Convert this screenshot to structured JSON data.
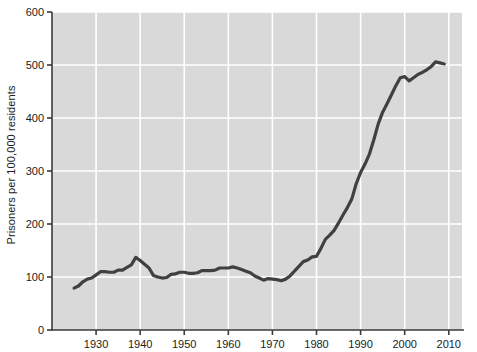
{
  "chart_data": {
    "type": "line",
    "title": "",
    "xlabel": "",
    "ylabel": "Prisoners per 100,000 residents",
    "xlim": [
      1920,
      2013
    ],
    "ylim": [
      0,
      600
    ],
    "grid": true,
    "legend": "none",
    "series": [
      {
        "name": "U.S. incarceration rate",
        "color": "#404040",
        "x": [
          1925,
          1926,
          1927,
          1928,
          1929,
          1930,
          1931,
          1932,
          1933,
          1934,
          1935,
          1936,
          1937,
          1938,
          1939,
          1940,
          1941,
          1942,
          1943,
          1944,
          1945,
          1946,
          1947,
          1948,
          1949,
          1950,
          1951,
          1952,
          1953,
          1954,
          1955,
          1956,
          1957,
          1958,
          1959,
          1960,
          1961,
          1962,
          1963,
          1964,
          1965,
          1966,
          1967,
          1968,
          1969,
          1970,
          1971,
          1972,
          1973,
          1974,
          1975,
          1976,
          1977,
          1978,
          1979,
          1980,
          1981,
          1982,
          1983,
          1984,
          1985,
          1986,
          1987,
          1988,
          1989,
          1990,
          1991,
          1992,
          1993,
          1994,
          1995,
          1996,
          1997,
          1998,
          1999,
          2000,
          2001,
          2002,
          2003,
          2004,
          2005,
          2006,
          2007,
          2008,
          2009
        ],
        "values": [
          79,
          83,
          91,
          96,
          98,
          104,
          110,
          110,
          109,
          109,
          113,
          113,
          118,
          123,
          137,
          131,
          124,
          117,
          103,
          100,
          98,
          99,
          105,
          106,
          109,
          109,
          107,
          107,
          108,
          112,
          112,
          112,
          113,
          117,
          117,
          117,
          119,
          117,
          114,
          111,
          108,
          102,
          98,
          94,
          97,
          96,
          95,
          93,
          96,
          102,
          111,
          120,
          129,
          132,
          138,
          139,
          154,
          171,
          179,
          188,
          202,
          217,
          231,
          247,
          276,
          297,
          313,
          332,
          359,
          389,
          411,
          427,
          444,
          461,
          476,
          478,
          470,
          476,
          482,
          486,
          491,
          497,
          506,
          504,
          502
        ]
      }
    ],
    "y_ticks": [
      0,
      100,
      200,
      300,
      400,
      500,
      600
    ],
    "x_ticks": [
      1930,
      1940,
      1950,
      1960,
      1970,
      1980,
      1990,
      2000,
      2010
    ],
    "style": {
      "plot_background": "#d9d9d9",
      "grid_color": "#ffffff",
      "axis_color": "#3a3a3a",
      "line_color": "#404040",
      "line_width": 3.2,
      "text_color": "#1b1b1b",
      "page_background": "#ffffff"
    }
  }
}
